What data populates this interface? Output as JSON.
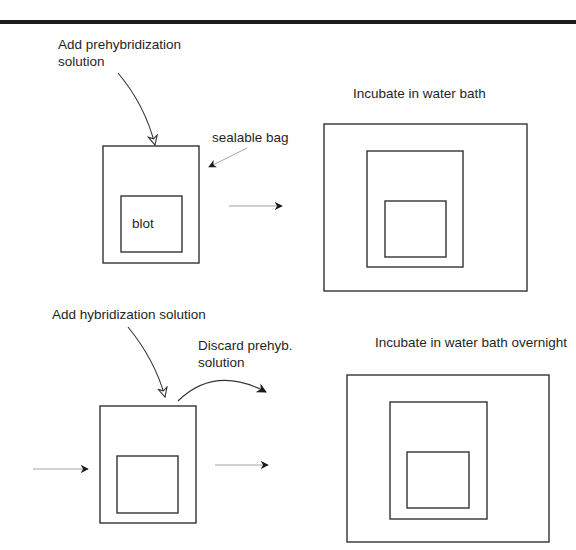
{
  "figure": {
    "title_rule": "horizontal-rule",
    "step1": {
      "add_label_line1": "Add prehybridization",
      "add_label_line2": "solution",
      "bag_label": "sealable bag",
      "blot_label": "blot",
      "incubate_label": "Incubate in water bath"
    },
    "step2": {
      "add_label": "Add hybridization solution",
      "discard_label_line1": "Discard prehyb.",
      "discard_label_line2": "solution",
      "incubate_label": "Incubate in water bath overnight"
    },
    "colors": {
      "line": "#333333",
      "text": "#1f1f1f",
      "rule": "#1c1c1c"
    }
  }
}
